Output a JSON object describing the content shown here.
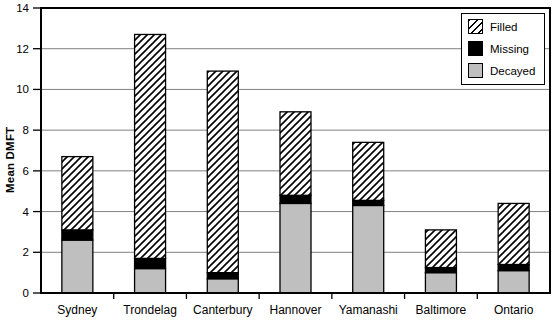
{
  "chart_data": {
    "type": "bar",
    "stacked": true,
    "title": "",
    "ylabel": "Mean DMFT",
    "xlabel": "",
    "ylim": [
      0,
      14
    ],
    "yticks": [
      0,
      2,
      4,
      6,
      8,
      10,
      12,
      14
    ],
    "grid": "horizontal",
    "frame": true,
    "categories": [
      "Sydney",
      "Trondelag",
      "Canterbury",
      "Hannover",
      "Yamanashi",
      "Baltimore",
      "Ontario"
    ],
    "series": [
      {
        "name": "Decayed",
        "style": "solid-gray",
        "color": "#bfbfbf",
        "values": [
          2.6,
          1.2,
          0.7,
          4.4,
          4.3,
          1.0,
          1.1
        ]
      },
      {
        "name": "Missing",
        "style": "solid-black",
        "color": "#000000",
        "values": [
          0.5,
          0.5,
          0.3,
          0.4,
          0.25,
          0.25,
          0.3
        ]
      },
      {
        "name": "Filled",
        "style": "diagonal-hatch",
        "color": "#ffffff",
        "values": [
          3.6,
          11.0,
          9.9,
          4.1,
          2.85,
          1.85,
          3.0
        ]
      }
    ],
    "stack_totals": [
      6.7,
      12.7,
      10.9,
      8.9,
      7.4,
      3.1,
      4.4
    ],
    "legend": {
      "position": "top-right",
      "entries": [
        "Filled",
        "Missing",
        "Decayed"
      ]
    }
  },
  "colors": {
    "background": "#ffffff",
    "frame": "#000000",
    "gridline": "#808080",
    "tick": "#000000",
    "bar_gray": "#bfbfbf",
    "bar_black": "#000000",
    "hatch_line": "#000000"
  }
}
